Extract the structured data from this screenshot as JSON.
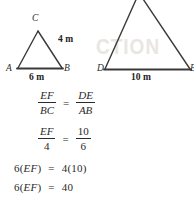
{
  "figure": {
    "watermark_text": "CTION",
    "left_triangle": {
      "name": "triangle-ABC",
      "vertex_top_label": "C",
      "vertex_left_label": "A",
      "vertex_right_label": "B",
      "base_length_label": "6 m",
      "right_side_length_label": "4 m"
    },
    "right_triangle": {
      "name": "triangle-DEF",
      "vertex_left_label": "D",
      "vertex_right_label": "E",
      "base_length_label": "10 m"
    }
  },
  "equations": {
    "line1": {
      "left_numerator": "EF",
      "left_denominator": "BC",
      "operator": "=",
      "right_numerator": "DE",
      "right_denominator": "AB"
    },
    "line2": {
      "left_numerator": "EF",
      "left_denominator": "4",
      "operator": "=",
      "right_numerator": "10",
      "right_denominator": "6"
    },
    "line3": {
      "coefficient": "6(",
      "variable": "EF",
      "close": ")",
      "operator": "=",
      "result": "4(10)"
    },
    "line4": {
      "coefficient": "6(",
      "variable": "EF",
      "close": ")",
      "operator": "=",
      "result": "40"
    }
  },
  "colors": {
    "stroke": "#3a3a3a",
    "text": "#2a2a2a",
    "watermark": "#e9e6e2",
    "background": "#ffffff"
  }
}
